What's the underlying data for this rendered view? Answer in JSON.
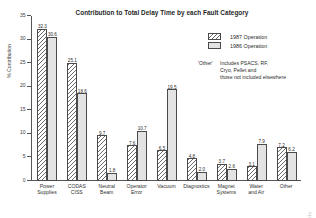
{
  "chart_data": {
    "type": "bar",
    "title": "Contribution to Total Delay Time by each Fault Category",
    "xlabel": "",
    "ylabel": "% Contribution",
    "ylim": [
      0,
      35
    ],
    "yticks": [
      0,
      5,
      10,
      15,
      20,
      25,
      30,
      35
    ],
    "ytick_labels": [
      "0",
      "5",
      "10",
      "15",
      "20",
      "25",
      "30",
      "35"
    ],
    "grid": false,
    "legend_position": "upper right",
    "categories": [
      "Power Supplies",
      "CODAS CISS",
      "Neutral Beam",
      "Operator Error",
      "Vacuum",
      "Diagnostics",
      "Magnet Systems",
      "Water and Air",
      "Other"
    ],
    "category_lines": [
      [
        "Power",
        "Supplies"
      ],
      [
        "CODAS",
        "CISS"
      ],
      [
        "Neutral",
        "Beam"
      ],
      [
        "Operator",
        "Error"
      ],
      [
        "Vacuum",
        ""
      ],
      [
        "Diagnostics",
        ""
      ],
      [
        "Magnet",
        "Systems"
      ],
      [
        "Water",
        "and Air"
      ],
      [
        "Other",
        ""
      ]
    ],
    "series": [
      {
        "name": "1987 Operation",
        "pattern": "diagonal-hatch",
        "values": [
          32.3,
          25.1,
          9.7,
          7.6,
          6.5,
          4.8,
          3.7,
          3.1,
          7.2
        ],
        "labels": [
          "32.3",
          "25.1",
          "9.7",
          "7.6",
          "6.5",
          "4.8",
          "3.7",
          "3.1",
          "7.2"
        ]
      },
      {
        "name": "1986 Operation",
        "pattern": "stipple-gray",
        "values": [
          30.6,
          18.6,
          1.8,
          10.7,
          19.5,
          2.0,
          2.6,
          7.9,
          6.2
        ],
        "labels": [
          "30.6",
          "18.6",
          "1.8",
          "10.7",
          "19.5",
          "2.0",
          "2.6",
          "7.9",
          "6.2"
        ]
      }
    ],
    "annotation": {
      "term": "'Other'",
      "lines": [
        "Includes PSACS, RF,",
        "Cryo, Pellet and",
        "those not included elsewhere"
      ]
    },
    "side_code": "JG88.119/1c"
  }
}
